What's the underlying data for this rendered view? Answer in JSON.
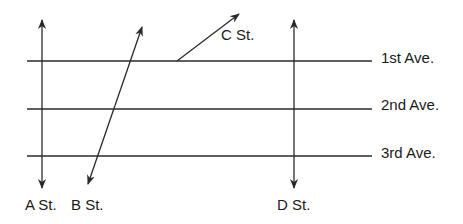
{
  "diagram": {
    "colors": {
      "line": "#2a2a2a",
      "background": "#ffffff",
      "text": "#1a1a1a"
    },
    "avenues": [
      {
        "label": "1st Ave.",
        "y": 61
      },
      {
        "label": "2nd Ave.",
        "y": 109
      },
      {
        "label": "3rd Ave.",
        "y": 156
      }
    ],
    "streets": [
      {
        "label": "A St.",
        "direction": "two-way",
        "from": [
          42,
          20
        ],
        "to": [
          42,
          188
        ]
      },
      {
        "label": "B St.",
        "direction": "two-way",
        "from": [
          142,
          27
        ],
        "to": [
          88,
          184
        ]
      },
      {
        "label": "C St.",
        "direction": "one-way",
        "from": [
          177,
          61
        ],
        "to": [
          239,
          14
        ]
      },
      {
        "label": "D St.",
        "direction": "two-way",
        "from": [
          294,
          20
        ],
        "to": [
          294,
          188
        ]
      }
    ]
  }
}
